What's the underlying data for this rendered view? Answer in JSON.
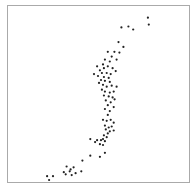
{
  "chart_data": {
    "type": "scatter",
    "title": "",
    "xlabel": "",
    "ylabel": "",
    "xlim": [
      0,
      100
    ],
    "ylim": [
      0,
      100
    ],
    "grid": false,
    "legend": null,
    "ticks": "none",
    "point_color": "#222222",
    "frame_color": "#aaaaaa",
    "series": [
      {
        "name": "points",
        "points": [
          [
            77.6,
            94.4
          ],
          [
            78.1,
            90.4
          ],
          [
            62.8,
            88.8
          ],
          [
            66.7,
            89.3
          ],
          [
            69.4,
            87.6
          ],
          [
            61.2,
            80.3
          ],
          [
            63.9,
            77.5
          ],
          [
            58.9,
            74.7
          ],
          [
            61.7,
            74.2
          ],
          [
            55.2,
            74.7
          ],
          [
            57.4,
            71.9
          ],
          [
            60.1,
            70.2
          ],
          [
            53.6,
            70.2
          ],
          [
            56.3,
            69.1
          ],
          [
            52.5,
            67.4
          ],
          [
            55.2,
            66.3
          ],
          [
            49.2,
            66.3
          ],
          [
            53.0,
            65.2
          ],
          [
            57.9,
            65.2
          ],
          [
            50.8,
            64.0
          ],
          [
            51.9,
            62.4
          ],
          [
            54.6,
            62.4
          ],
          [
            56.8,
            61.8
          ],
          [
            59.6,
            63.5
          ],
          [
            47.5,
            61.8
          ],
          [
            49.7,
            60.7
          ],
          [
            53.0,
            60.1
          ],
          [
            55.7,
            59.6
          ],
          [
            51.4,
            58.4
          ],
          [
            53.6,
            57.9
          ],
          [
            56.3,
            57.3
          ],
          [
            50.3,
            56.7
          ],
          [
            52.5,
            55.6
          ],
          [
            54.6,
            54.5
          ],
          [
            57.4,
            55.1
          ],
          [
            60.1,
            54.5
          ],
          [
            51.9,
            52.8
          ],
          [
            53.6,
            51.7
          ],
          [
            56.3,
            51.1
          ],
          [
            58.5,
            51.7
          ],
          [
            53.0,
            49.4
          ],
          [
            55.7,
            48.9
          ],
          [
            57.9,
            48.3
          ],
          [
            59.0,
            47.2
          ],
          [
            54.1,
            46.6
          ],
          [
            56.8,
            45.5
          ],
          [
            55.2,
            43.8
          ],
          [
            58.5,
            42.7
          ],
          [
            53.6,
            41.6
          ],
          [
            56.3,
            40.4
          ],
          [
            55.2,
            38.2
          ],
          [
            52.5,
            35.4
          ],
          [
            54.6,
            34.8
          ],
          [
            56.8,
            35.4
          ],
          [
            58.5,
            33.7
          ],
          [
            53.6,
            32.0
          ],
          [
            55.7,
            30.9
          ],
          [
            57.4,
            31.5
          ],
          [
            54.1,
            29.8
          ],
          [
            56.3,
            28.7
          ],
          [
            58.5,
            29.2
          ],
          [
            55.2,
            27.5
          ],
          [
            53.0,
            26.4
          ],
          [
            54.6,
            25.3
          ],
          [
            52.5,
            24.2
          ],
          [
            53.6,
            23.0
          ],
          [
            51.4,
            23.6
          ],
          [
            49.2,
            23.6
          ],
          [
            45.4,
            24.2
          ],
          [
            48.1,
            22.5
          ],
          [
            50.8,
            21.3
          ],
          [
            52.5,
            20.8
          ],
          [
            45.4,
            14.6
          ],
          [
            50.8,
            14.0
          ],
          [
            53.6,
            16.3
          ],
          [
            41.0,
            11.8
          ],
          [
            32.2,
            8.4
          ],
          [
            36.1,
            7.9
          ],
          [
            30.6,
            5.1
          ],
          [
            40.4,
            5.6
          ],
          [
            33.9,
            5.6
          ],
          [
            31.7,
            3.9
          ],
          [
            35.0,
            3.4
          ],
          [
            37.2,
            4.5
          ],
          [
            21.3,
            2.8
          ],
          [
            24.6,
            2.8
          ],
          [
            22.4,
            0.6
          ],
          [
            34.4,
            6.7
          ]
        ]
      }
    ]
  }
}
